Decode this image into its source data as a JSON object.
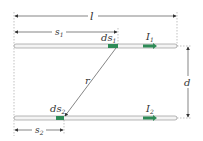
{
  "labels": {
    "length": "l",
    "s1": "s",
    "s1_sub": "1",
    "ds1": "ds",
    "ds1_sub": "1",
    "I1": "I",
    "I1_sub": "1",
    "r": "r",
    "d": "d",
    "ds2": "ds",
    "ds2_sub": "2",
    "I2": "I",
    "I2_sub": "2",
    "s2": "s",
    "s2_sub": "2"
  },
  "colors": {
    "wire": "#f4f4f4",
    "wire_stroke": "#888888",
    "element": "#2e8b57",
    "line": "#333333",
    "guide": "#999999"
  }
}
